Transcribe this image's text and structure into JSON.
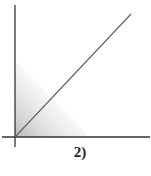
{
  "diagram": {
    "label": "2)",
    "axes": {
      "origin": [
        15,
        137
      ],
      "x_end": [
        150,
        137
      ],
      "y_top": [
        15,
        5
      ],
      "color": "#333333"
    },
    "line": {
      "from": [
        15,
        137
      ],
      "to": [
        131,
        14
      ],
      "color": "#666666"
    },
    "shaded_region": {
      "shape": "triangle",
      "vertices": [
        [
          15,
          60
        ],
        [
          15,
          137
        ],
        [
          90,
          137
        ]
      ],
      "color": "#bbbbbb"
    }
  }
}
